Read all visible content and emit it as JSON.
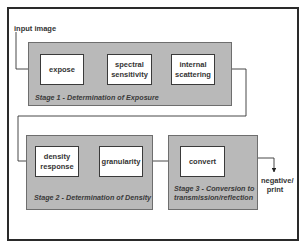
{
  "diagram": {
    "input_label": "input image",
    "output_label": "negative/\nprint",
    "output_label_lines": [
      "negative/",
      "print"
    ],
    "colors": {
      "stage_fill": "#b9b9b9",
      "box_fill": "#ffffff",
      "line": "#333333"
    },
    "stages": [
      {
        "label": "Stage 1 - Determination of Exposure",
        "boxes": [
          {
            "lines": [
              "expose"
            ]
          },
          {
            "lines": [
              "spectral",
              "sensitivity"
            ]
          },
          {
            "lines": [
              "internal",
              "scattering"
            ]
          }
        ]
      },
      {
        "label": "Stage 2 - Determination of Density",
        "boxes": [
          {
            "lines": [
              "density",
              "response"
            ]
          },
          {
            "lines": [
              "granularity"
            ]
          }
        ]
      },
      {
        "label_lines": [
          "Stage 3 - Conversion to",
          "transmission/reflection"
        ],
        "boxes": [
          {
            "lines": [
              "convert"
            ]
          }
        ]
      }
    ],
    "flow": [
      "input image",
      "expose",
      "spectral sensitivity",
      "internal scattering",
      "density response",
      "granularity",
      "convert",
      "negative/print"
    ]
  }
}
